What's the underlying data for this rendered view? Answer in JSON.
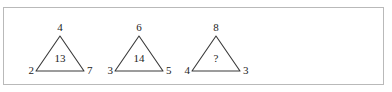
{
  "figure": {
    "frame_color": "#b9b9b9",
    "background_color": "#ffffff",
    "stroke_color": "#3a3a3a",
    "text_color": "#1c1c1c",
    "unknown_symbol": "?",
    "triangles": [
      {
        "id": "triangle-1",
        "apex": "4",
        "bottom_left": "2",
        "bottom_right": "7",
        "center": "13"
      },
      {
        "id": "triangle-2",
        "apex": "6",
        "bottom_left": "3",
        "bottom_right": "5",
        "center": "14"
      },
      {
        "id": "triangle-3",
        "apex": "8",
        "bottom_left": "4",
        "bottom_right": "3",
        "center": "?"
      }
    ]
  }
}
